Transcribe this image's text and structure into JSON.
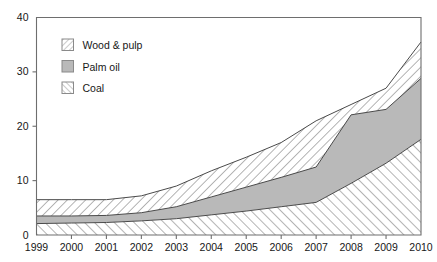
{
  "chart_data": {
    "type": "area",
    "title": "",
    "xlabel": "",
    "ylabel": "",
    "stacked": true,
    "grid": false,
    "legend_position": "top-left-inside",
    "xlim": [
      1999,
      2010
    ],
    "ylim": [
      0,
      40
    ],
    "x": [
      1999,
      2000,
      2001,
      2002,
      2003,
      2004,
      2005,
      2006,
      2007,
      2008,
      2009,
      2010
    ],
    "xtick_labels": [
      "1999",
      "2000",
      "2001",
      "2002",
      "2003",
      "2004",
      "2005",
      "2006",
      "2007",
      "2008",
      "2009",
      "2010"
    ],
    "ytick_labels": [
      "0",
      "10",
      "20",
      "30",
      "40"
    ],
    "ytick_values": [
      0,
      10,
      20,
      30,
      40
    ],
    "series": [
      {
        "name": "Coal",
        "pattern": "forward-slash-hatch",
        "color": "#ffffff",
        "stack_order": 1,
        "values": [
          2.1,
          2.2,
          2.3,
          2.6,
          3.0,
          3.7,
          4.4,
          5.2,
          6.0,
          9.5,
          13.2,
          17.6
        ]
      },
      {
        "name": "Palm oil",
        "pattern": "solid-gray",
        "color": "#b9b9b9",
        "stack_order": 2,
        "values": [
          1.4,
          1.3,
          1.3,
          1.5,
          2.2,
          3.3,
          4.4,
          5.4,
          6.5,
          12.6,
          9.9,
          11.2
        ]
      },
      {
        "name": "Wood & pulp",
        "pattern": "backslash-hatch",
        "color": "#ffffff",
        "stack_order": 3,
        "values": [
          3.0,
          3.0,
          2.9,
          3.1,
          3.8,
          4.8,
          5.5,
          6.4,
          8.5,
          1.9,
          3.9,
          6.7
        ]
      }
    ],
    "stack_totals": [
      6.5,
      6.5,
      6.5,
      7.2,
      9.0,
      11.8,
      14.3,
      17.0,
      21.0,
      24.0,
      27.0,
      35.5
    ],
    "cum_coal": [
      2.1,
      2.2,
      2.3,
      2.6,
      3.0,
      3.7,
      4.4,
      5.2,
      6.0,
      9.5,
      13.2,
      17.6
    ],
    "cum_palm": [
      3.5,
      3.5,
      3.6,
      4.1,
      5.2,
      7.0,
      8.8,
      10.6,
      12.5,
      22.1,
      23.1,
      28.8
    ]
  },
  "legend": {
    "items": [
      {
        "label": "Wood & pulp",
        "swatch": "backslash-hatch-swatch"
      },
      {
        "label": "Palm oil",
        "swatch": "solid-gray-swatch"
      },
      {
        "label": "Coal",
        "swatch": "forward-slash-hatch-swatch"
      }
    ]
  },
  "axes": {
    "y": {
      "labels": [
        "40",
        "30",
        "20",
        "10",
        "0"
      ]
    },
    "x": {
      "labels": [
        "1999",
        "2000",
        "2001",
        "2002",
        "2003",
        "2004",
        "2005",
        "2006",
        "2007",
        "2008",
        "2009",
        "2010"
      ]
    }
  }
}
